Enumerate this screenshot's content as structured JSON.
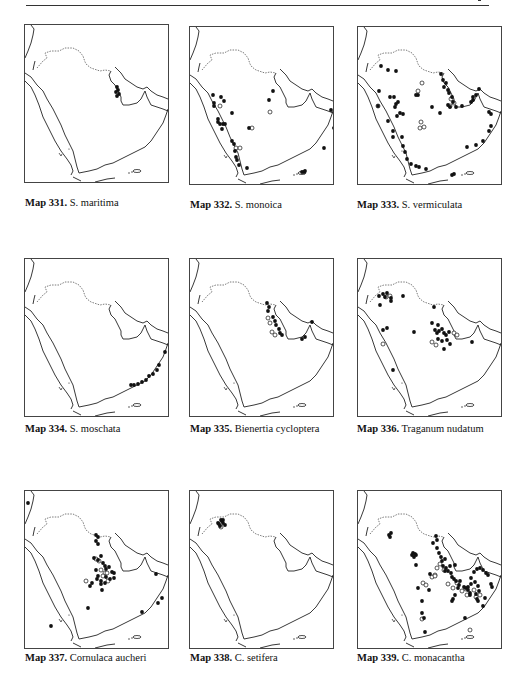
{
  "page": {
    "header_rule": true
  },
  "maps": [
    {
      "number": "Map 331.",
      "species": "S. maritima",
      "panel": {
        "x": 24,
        "y": 24
      },
      "caption_pos": {
        "x": 25,
        "y": 197
      },
      "points_filled": [
        [
          92,
          62
        ],
        [
          93,
          65
        ],
        [
          91,
          67
        ],
        [
          94,
          69
        ],
        [
          92,
          71
        ]
      ],
      "points_open": []
    },
    {
      "number": "Map 332.",
      "species": "S. monoica",
      "panel": {
        "x": 189,
        "y": 26
      },
      "caption_pos": {
        "x": 190,
        "y": 199
      },
      "points_filled": [
        [
          23,
          68
        ],
        [
          31,
          70
        ],
        [
          34,
          74
        ],
        [
          24,
          76
        ],
        [
          24,
          79
        ],
        [
          42,
          86
        ],
        [
          28,
          92
        ],
        [
          28,
          95
        ],
        [
          30,
          97
        ],
        [
          33,
          97
        ],
        [
          35,
          97
        ],
        [
          32,
          102
        ],
        [
          42,
          114
        ],
        [
          44,
          117
        ],
        [
          45,
          124
        ],
        [
          46,
          130
        ],
        [
          47,
          133
        ],
        [
          49,
          138
        ],
        [
          57,
          141
        ],
        [
          79,
          73
        ],
        [
          59,
          101
        ],
        [
          141,
          83
        ],
        [
          144,
          101
        ],
        [
          134,
          121
        ],
        [
          112,
          145
        ],
        [
          114,
          145
        ],
        [
          115,
          144
        ],
        [
          83,
          64
        ]
      ],
      "points_open": [
        [
          30,
          79
        ],
        [
          46,
          121
        ],
        [
          50,
          121
        ],
        [
          80,
          85
        ],
        [
          62,
          101
        ]
      ]
    },
    {
      "number": "Map 333.",
      "species": "S. vermiculata",
      "panel": {
        "x": 357,
        "y": 26
      },
      "caption_pos": {
        "x": 357,
        "y": 199
      },
      "points_filled": [
        [
          23,
          39
        ],
        [
          30,
          43
        ],
        [
          38,
          44
        ],
        [
          21,
          64
        ],
        [
          32,
          70
        ],
        [
          36,
          70
        ],
        [
          40,
          75
        ],
        [
          38,
          77
        ],
        [
          37,
          80
        ],
        [
          20,
          79
        ],
        [
          42,
          86
        ],
        [
          45,
          87
        ],
        [
          39,
          89
        ],
        [
          30,
          94
        ],
        [
          35,
          104
        ],
        [
          35,
          110
        ],
        [
          44,
          110
        ],
        [
          45,
          119
        ],
        [
          47,
          125
        ],
        [
          49,
          132
        ],
        [
          53,
          137
        ],
        [
          58,
          139
        ],
        [
          68,
          142
        ],
        [
          61,
          140
        ],
        [
          74,
          80
        ],
        [
          82,
          86
        ],
        [
          83,
          47
        ],
        [
          85,
          53
        ],
        [
          88,
          56
        ],
        [
          86,
          60
        ],
        [
          90,
          63
        ],
        [
          91,
          66
        ],
        [
          94,
          70
        ],
        [
          95,
          75
        ],
        [
          90,
          78
        ],
        [
          92,
          80
        ],
        [
          98,
          80
        ],
        [
          104,
          79
        ],
        [
          113,
          75
        ],
        [
          115,
          73
        ],
        [
          118,
          68
        ],
        [
          121,
          62
        ],
        [
          115,
          70
        ],
        [
          131,
          85
        ],
        [
          133,
          87
        ],
        [
          133,
          99
        ],
        [
          131,
          104
        ],
        [
          125,
          114
        ],
        [
          118,
          118
        ],
        [
          109,
          120
        ],
        [
          94,
          148
        ],
        [
          96,
          147
        ],
        [
          60,
          68
        ],
        [
          58,
          68
        ]
      ],
      "points_open": [
        [
          64,
          56
        ],
        [
          20,
          79
        ],
        [
          63,
          95
        ],
        [
          62,
          101
        ],
        [
          66,
          100
        ],
        [
          60,
          64
        ],
        [
          93,
          72
        ],
        [
          96,
          76
        ],
        [
          92,
          79
        ]
      ]
    },
    {
      "number": "Map 334.",
      "species": "S. moschata",
      "panel": {
        "x": 24,
        "y": 258
      },
      "caption_pos": {
        "x": 25,
        "y": 423
      },
      "points_filled": [
        [
          140,
          93
        ],
        [
          134,
          106
        ],
        [
          132,
          111
        ],
        [
          128,
          115
        ],
        [
          124,
          117
        ],
        [
          121,
          121
        ],
        [
          117,
          123
        ],
        [
          113,
          125
        ],
        [
          109,
          126
        ],
        [
          106,
          126
        ]
      ],
      "points_open": []
    },
    {
      "number": "Map 335.",
      "species": "Bienertia cycloptera",
      "panel": {
        "x": 189,
        "y": 258
      },
      "caption_pos": {
        "x": 190,
        "y": 423
      },
      "points_filled": [
        [
          77,
          44
        ],
        [
          79,
          48
        ],
        [
          78,
          52
        ],
        [
          83,
          58
        ],
        [
          85,
          62
        ],
        [
          86,
          66
        ],
        [
          89,
          70
        ],
        [
          90,
          74
        ],
        [
          92,
          76
        ],
        [
          122,
          63
        ],
        [
          115,
          78
        ],
        [
          112,
          80
        ]
      ],
      "points_open": [
        [
          78,
          59
        ],
        [
          80,
          64
        ],
        [
          82,
          73
        ],
        [
          85,
          76
        ]
      ]
    },
    {
      "number": "Map 336.",
      "species": "Traganum nudatum",
      "panel": {
        "x": 357,
        "y": 258
      },
      "caption_pos": {
        "x": 357,
        "y": 423
      },
      "points_filled": [
        [
          21,
          37
        ],
        [
          25,
          35
        ],
        [
          27,
          38
        ],
        [
          29,
          34
        ],
        [
          33,
          39
        ],
        [
          33,
          42
        ],
        [
          22,
          46
        ],
        [
          45,
          37
        ],
        [
          76,
          48
        ],
        [
          74,
          64
        ],
        [
          80,
          66
        ],
        [
          77,
          71
        ],
        [
          79,
          74
        ],
        [
          81,
          72
        ],
        [
          84,
          70
        ],
        [
          86,
          74
        ],
        [
          88,
          76
        ],
        [
          91,
          73
        ],
        [
          80,
          80
        ],
        [
          84,
          82
        ],
        [
          89,
          81
        ],
        [
          92,
          85
        ],
        [
          86,
          90
        ],
        [
          114,
          83
        ],
        [
          56,
          73
        ],
        [
          25,
          71
        ],
        [
          29,
          69
        ],
        [
          35,
          111
        ]
      ],
      "points_open": [
        [
          28,
          38
        ],
        [
          32,
          37
        ],
        [
          25,
          85
        ],
        [
          74,
          83
        ],
        [
          78,
          86
        ],
        [
          96,
          74
        ],
        [
          99,
          76
        ]
      ]
    },
    {
      "number": "Map 337.",
      "species": "Cornulaca aucheri",
      "panel": {
        "x": 24,
        "y": 490
      },
      "caption_pos": {
        "x": 25,
        "y": 652
      },
      "points_filled": [
        [
          71,
          44
        ],
        [
          73,
          46
        ],
        [
          71,
          50
        ],
        [
          73,
          53
        ],
        [
          69,
          67
        ],
        [
          73,
          69
        ],
        [
          76,
          65
        ],
        [
          78,
          72
        ],
        [
          80,
          75
        ],
        [
          81,
          78
        ],
        [
          84,
          76
        ],
        [
          87,
          81
        ],
        [
          89,
          82
        ],
        [
          89,
          87
        ],
        [
          85,
          88
        ],
        [
          81,
          86
        ],
        [
          80,
          92
        ],
        [
          76,
          90
        ],
        [
          73,
          85
        ],
        [
          71,
          79
        ],
        [
          72,
          88
        ],
        [
          77,
          99
        ],
        [
          67,
          92
        ],
        [
          65,
          95
        ],
        [
          76,
          93
        ],
        [
          63,
          117
        ],
        [
          117,
          121
        ],
        [
          133,
          112
        ],
        [
          137,
          107
        ],
        [
          131,
          83
        ],
        [
          3,
          12
        ],
        [
          26,
          135
        ]
      ],
      "points_open": [
        [
          61,
          90
        ],
        [
          71,
          68
        ],
        [
          74,
          70
        ],
        [
          76,
          79
        ],
        [
          80,
          82
        ],
        [
          82,
          82
        ],
        [
          83,
          90
        ],
        [
          78,
          85
        ]
      ]
    },
    {
      "number": "Map 338.",
      "species": "C. setifera",
      "panel": {
        "x": 189,
        "y": 490
      },
      "caption_pos": {
        "x": 190,
        "y": 652
      },
      "points_filled": [
        [
          35,
          34
        ],
        [
          33,
          32
        ],
        [
          32,
          30
        ],
        [
          31,
          29
        ],
        [
          28,
          32
        ],
        [
          29,
          33
        ],
        [
          30,
          35
        ],
        [
          33,
          29
        ]
      ],
      "points_open": [
        [
          31,
          36
        ]
      ]
    },
    {
      "number": "Map 339.",
      "species": "C. monacantha",
      "panel": {
        "x": 357,
        "y": 490
      },
      "caption_pos": {
        "x": 357,
        "y": 652
      },
      "points_filled": [
        [
          31,
          44
        ],
        [
          33,
          42
        ],
        [
          32,
          46
        ],
        [
          55,
          62
        ],
        [
          57,
          63
        ],
        [
          56,
          66
        ],
        [
          54,
          64
        ],
        [
          58,
          64
        ],
        [
          75,
          52
        ],
        [
          78,
          45
        ],
        [
          79,
          49
        ],
        [
          79,
          57
        ],
        [
          81,
          62
        ],
        [
          83,
          66
        ],
        [
          84,
          70
        ],
        [
          87,
          68
        ],
        [
          85,
          75
        ],
        [
          88,
          77
        ],
        [
          90,
          80
        ],
        [
          92,
          75
        ],
        [
          93,
          82
        ],
        [
          94,
          86
        ],
        [
          96,
          88
        ],
        [
          98,
          90
        ],
        [
          101,
          94
        ],
        [
          100,
          97
        ],
        [
          102,
          90
        ],
        [
          106,
          96
        ],
        [
          108,
          97
        ],
        [
          110,
          96
        ],
        [
          113,
          93
        ],
        [
          117,
          91
        ],
        [
          120,
          95
        ],
        [
          121,
          100
        ],
        [
          118,
          103
        ],
        [
          112,
          102
        ],
        [
          110,
          99
        ],
        [
          113,
          87
        ],
        [
          116,
          81
        ],
        [
          119,
          78
        ],
        [
          122,
          77
        ],
        [
          125,
          79
        ],
        [
          128,
          82
        ],
        [
          130,
          84
        ],
        [
          133,
          93
        ],
        [
          134,
          96
        ],
        [
          127,
          107
        ],
        [
          125,
          115
        ],
        [
          120,
          110
        ],
        [
          119,
          108
        ],
        [
          112,
          104
        ],
        [
          97,
          104
        ],
        [
          95,
          108
        ],
        [
          94,
          110
        ],
        [
          60,
          97
        ],
        [
          58,
          74
        ],
        [
          64,
          110
        ],
        [
          64,
          122
        ],
        [
          66,
          127
        ],
        [
          71,
          99
        ],
        [
          67,
          141
        ],
        [
          87,
          80
        ],
        [
          72,
          83
        ],
        [
          97,
          74
        ],
        [
          107,
          127
        ]
      ],
      "points_open": [
        [
          65,
          92
        ],
        [
          68,
          94
        ],
        [
          74,
          86
        ],
        [
          77,
          84
        ],
        [
          82,
          73
        ],
        [
          86,
          79
        ],
        [
          90,
          93
        ],
        [
          95,
          97
        ],
        [
          99,
          92
        ],
        [
          104,
          100
        ],
        [
          108,
          98
        ],
        [
          116,
          99
        ],
        [
          118,
          106
        ],
        [
          122,
          104
        ],
        [
          109,
          104
        ],
        [
          64,
          128
        ],
        [
          112,
          139
        ],
        [
          77,
          85
        ],
        [
          79,
          77
        ]
      ]
    }
  ],
  "chart_data": [
    {
      "type": "scatter",
      "title": "Map 331. S. maritima",
      "series": [
        {
          "name": "records (filled)",
          "count": 5
        }
      ],
      "region": "Arabian Peninsula"
    },
    {
      "type": "scatter",
      "title": "Map 332. S. monoica",
      "series": [
        {
          "name": "records (filled)",
          "count": 28
        },
        {
          "name": "records (open)",
          "count": 5
        }
      ],
      "region": "Arabian Peninsula"
    },
    {
      "type": "scatter",
      "title": "Map 333. S. vermiculata",
      "series": [
        {
          "name": "records (filled)",
          "count": 56
        },
        {
          "name": "records (open)",
          "count": 9
        }
      ],
      "region": "Arabian Peninsula"
    },
    {
      "type": "scatter",
      "title": "Map 334. S. moschata",
      "series": [
        {
          "name": "records (filled)",
          "count": 10
        }
      ],
      "region": "Arabian Peninsula"
    },
    {
      "type": "scatter",
      "title": "Map 335. Bienertia cycloptera",
      "series": [
        {
          "name": "records (filled)",
          "count": 12
        },
        {
          "name": "records (open)",
          "count": 4
        }
      ],
      "region": "Arabian Peninsula"
    },
    {
      "type": "scatter",
      "title": "Map 336. Traganum nudatum",
      "series": [
        {
          "name": "records (filled)",
          "count": 28
        },
        {
          "name": "records (open)",
          "count": 7
        }
      ],
      "region": "Arabian Peninsula"
    },
    {
      "type": "scatter",
      "title": "Map 337. Cornulaca aucheri",
      "series": [
        {
          "name": "records (filled)",
          "count": 32
        },
        {
          "name": "records (open)",
          "count": 8
        }
      ],
      "region": "Arabian Peninsula"
    },
    {
      "type": "scatter",
      "title": "Map 338. C. setifera",
      "series": [
        {
          "name": "records (filled)",
          "count": 8
        },
        {
          "name": "records (open)",
          "count": 1
        }
      ],
      "region": "Arabian Peninsula"
    },
    {
      "type": "scatter",
      "title": "Map 339. C. monacantha",
      "series": [
        {
          "name": "records (filled)",
          "count": 65
        },
        {
          "name": "records (open)",
          "count": 19
        }
      ],
      "region": "Arabian Peninsula"
    }
  ]
}
